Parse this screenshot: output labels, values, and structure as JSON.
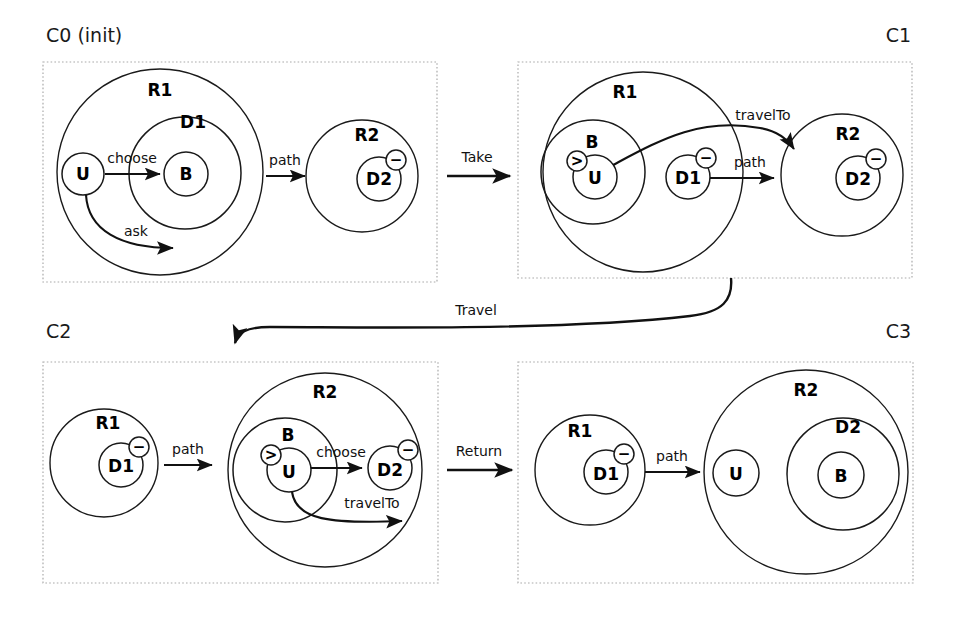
{
  "figure": {
    "background": "#ffffff",
    "ink": "#1a1a1a",
    "panel_border": "#aaaaaa"
  },
  "panels": [
    {
      "id": "C0",
      "label": "C0 (init)",
      "label_align": "left",
      "regions": [
        {
          "name": "R1",
          "label": "R1"
        },
        {
          "name": "R2",
          "label": "R2"
        }
      ],
      "nodes": [
        {
          "name": "U",
          "label": "U",
          "parent": "R1",
          "site": false,
          "control": false
        },
        {
          "name": "D1",
          "label": "D1",
          "parent": "R1",
          "site": false,
          "control": false
        },
        {
          "name": "B",
          "label": "B",
          "parent": "D1",
          "site": false,
          "control": false
        },
        {
          "name": "D2",
          "label": "D2",
          "parent": "R2",
          "site": true,
          "control": false
        }
      ],
      "edges": [
        {
          "label": "choose",
          "from": "U",
          "to": "B"
        },
        {
          "label": "ask",
          "from": "U",
          "to": "D1"
        },
        {
          "label": "path",
          "from": "R1",
          "to": "R2"
        }
      ]
    },
    {
      "id": "C1",
      "label": "C1",
      "label_align": "right",
      "regions": [
        {
          "name": "R1",
          "label": "R1"
        },
        {
          "name": "R2",
          "label": "R2"
        }
      ],
      "nodes": [
        {
          "name": "B",
          "label": "B",
          "parent": "R1",
          "site": false,
          "control": false
        },
        {
          "name": "U",
          "label": "U",
          "parent": "B",
          "site": false,
          "control": true
        },
        {
          "name": "D1",
          "label": "D1",
          "parent": "R1",
          "site": true,
          "control": false
        },
        {
          "name": "D2",
          "label": "D2",
          "parent": "R2",
          "site": true,
          "control": false
        }
      ],
      "edges": [
        {
          "label": "travelTo",
          "from": "U",
          "to": "R2"
        },
        {
          "label": "path",
          "from": "D1",
          "to": "R2"
        }
      ]
    },
    {
      "id": "C2",
      "label": "C2",
      "label_align": "left",
      "regions": [
        {
          "name": "R1",
          "label": "R1"
        },
        {
          "name": "R2",
          "label": "R2"
        }
      ],
      "nodes": [
        {
          "name": "D1",
          "label": "D1",
          "parent": "R1",
          "site": true,
          "control": false
        },
        {
          "name": "B",
          "label": "B",
          "parent": "R2",
          "site": false,
          "control": false
        },
        {
          "name": "U",
          "label": "U",
          "parent": "B",
          "site": false,
          "control": true
        },
        {
          "name": "D2",
          "label": "D2",
          "parent": "R2",
          "site": true,
          "control": false
        }
      ],
      "edges": [
        {
          "label": "path",
          "from": "R1",
          "to": "R2"
        },
        {
          "label": "choose",
          "from": "U",
          "to": "D2"
        },
        {
          "label": "travelTo",
          "from": "U",
          "to": "R2"
        }
      ]
    },
    {
      "id": "C3",
      "label": "C3",
      "label_align": "right",
      "regions": [
        {
          "name": "R1",
          "label": "R1"
        },
        {
          "name": "R2",
          "label": "R2"
        }
      ],
      "nodes": [
        {
          "name": "D1",
          "label": "D1",
          "parent": "R1",
          "site": true,
          "control": false
        },
        {
          "name": "U",
          "label": "U",
          "parent": "R2",
          "site": false,
          "control": false
        },
        {
          "name": "D2",
          "label": "D2",
          "parent": "R2",
          "site": false,
          "control": false
        },
        {
          "name": "B",
          "label": "B",
          "parent": "D2",
          "site": false,
          "control": false
        }
      ],
      "edges": [
        {
          "label": "path",
          "from": "R1",
          "to": "R2"
        }
      ]
    }
  ],
  "transitions": [
    {
      "name": "take",
      "label": "Take",
      "from": "C0",
      "to": "C1",
      "style": "straight"
    },
    {
      "name": "travel",
      "label": "Travel",
      "from": "C1",
      "to": "C2",
      "style": "curved"
    },
    {
      "name": "return",
      "label": "Return",
      "from": "C2",
      "to": "C3",
      "style": "straight"
    }
  ],
  "glyphs": {
    "site_mark": "−",
    "control_mark": ">"
  },
  "labels": {
    "c0": "C0 (init)",
    "c1": "C1",
    "c2": "C2",
    "c3": "C3",
    "R1": "R1",
    "R2": "R2",
    "U": "U",
    "B": "B",
    "D1": "D1",
    "D2": "D2",
    "choose": "choose",
    "ask": "ask",
    "path": "path",
    "travelTo": "travelTo",
    "Take": "Take",
    "Travel": "Travel",
    "Return": "Return",
    "site_mark": "−",
    "control_mark": ">"
  }
}
